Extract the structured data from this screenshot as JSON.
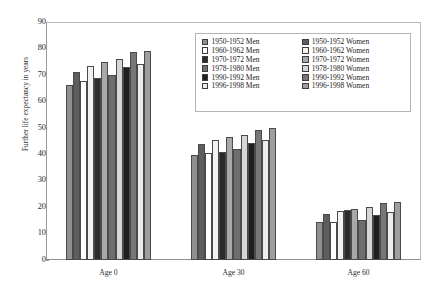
{
  "chart_data": {
    "type": "bar",
    "title": "",
    "subtitle": "",
    "xlabel": "",
    "ylabel": "Further life expectancy in years",
    "categories": [
      "Age 0",
      "Age 30",
      "Age 60"
    ],
    "ylim": [
      0,
      90
    ],
    "yticks": [
      0,
      10,
      20,
      30,
      40,
      50,
      60,
      70,
      80,
      90
    ],
    "grid": false,
    "legend_position": "top-right",
    "series": [
      {
        "name": "1950-1952 Men",
        "color": "#8f8f8f",
        "values": [
          66.2,
          39.9,
          14.2
        ]
      },
      {
        "name": "1950-1952 Women",
        "color": "#5e5e5e",
        "values": [
          71.2,
          44.0,
          17.4
        ]
      },
      {
        "name": "1960-1962 Men",
        "color": "#ffffff",
        "values": [
          67.8,
          40.4,
          14.3
        ]
      },
      {
        "name": "1960-1962 Women",
        "color": "#f2f2f2",
        "values": [
          73.5,
          45.5,
          18.4
        ]
      },
      {
        "name": "1970-1972 Men",
        "color": "#2b2b2b",
        "values": [
          68.7,
          41.0,
          19.0
        ]
      },
      {
        "name": "1970-1972 Women",
        "color": "#a8a8a8",
        "values": [
          74.8,
          46.4,
          19.4
        ]
      },
      {
        "name": "1978-1980 Men",
        "color": "#6e6e6e",
        "values": [
          70.1,
          41.9,
          15.3
        ]
      },
      {
        "name": "1978-1980 Women",
        "color": "#d6d6d6",
        "values": [
          76.1,
          47.2,
          19.9
        ]
      },
      {
        "name": "1990-1992 Men",
        "color": "#1f1f1f",
        "values": [
          72.9,
          44.3,
          17.0
        ]
      },
      {
        "name": "1990-1992 Women",
        "color": "#777777",
        "values": [
          78.7,
          49.2,
          21.4
        ]
      },
      {
        "name": "1996-1998 Men",
        "color": "#ededed",
        "values": [
          74.3,
          45.2,
          18.2
        ]
      },
      {
        "name": "1996-1998 Women",
        "color": "#9e9e9e",
        "values": [
          79.2,
          50.1,
          22.0
        ]
      }
    ]
  },
  "legend": {
    "columns": [
      {
        "items": [
          {
            "label": "1950-1952 Men",
            "color": "#8f8f8f"
          },
          {
            "label": "1960-1962 Men",
            "color": "#ffffff"
          },
          {
            "label": "1970-1972 Men",
            "color": "#2b2b2b"
          },
          {
            "label": "1978-1980 Men",
            "color": "#6e6e6e"
          },
          {
            "label": "1990-1992 Men",
            "color": "#1f1f1f"
          },
          {
            "label": "1996-1998 Men",
            "color": "#ededed"
          }
        ]
      },
      {
        "items": [
          {
            "label": "1950-1952 Women",
            "color": "#5e5e5e"
          },
          {
            "label": "1960-1962 Women",
            "color": "#f2f2f2"
          },
          {
            "label": "1970-1972 Women",
            "color": "#a8a8a8"
          },
          {
            "label": "1978-1980 Women",
            "color": "#d6d6d6"
          },
          {
            "label": "1990-1992 Women",
            "color": "#777777"
          },
          {
            "label": "1996-1998 Women",
            "color": "#9e9e9e"
          }
        ]
      }
    ]
  }
}
